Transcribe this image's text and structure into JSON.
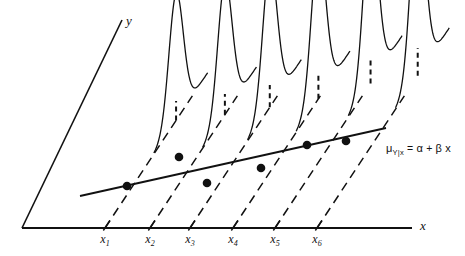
{
  "figure": {
    "background_color": "#ffffff",
    "stroke_color": "#111111",
    "width": 465,
    "height": 256
  },
  "axes": {
    "y_axis_label": "y",
    "x_axis_label": "x",
    "origin": {
      "x": 22,
      "y": 228
    },
    "y_axis_top": {
      "x": 122,
      "y": 20
    },
    "x_axis_right": {
      "x": 412,
      "y": 228
    }
  },
  "tick_labels": [
    {
      "label": "x",
      "sub": "1",
      "x": 105,
      "y": 232
    },
    {
      "label": "x",
      "sub": "2",
      "x": 150,
      "y": 232
    },
    {
      "label": "x",
      "sub": "3",
      "x": 190,
      "y": 232
    },
    {
      "label": "x",
      "sub": "4",
      "x": 233,
      "y": 232
    },
    {
      "label": "x",
      "sub": "5",
      "x": 275,
      "y": 232
    },
    {
      "label": "x",
      "sub": "6",
      "x": 317,
      "y": 232
    }
  ],
  "equation": {
    "mu": "μ",
    "subscript": "Y|x",
    "equals": "=",
    "alpha": "α",
    "plus": "+",
    "beta": "β",
    "variable": "x",
    "full_text": "μY|x = α + β x",
    "x": 386,
    "y": 142
  },
  "chart_data": {
    "type": "line",
    "xlabel": "x",
    "ylabel": "y",
    "grid": false,
    "legend": null,
    "categories": [
      "x1",
      "x2",
      "x3",
      "x4",
      "x5",
      "x6"
    ],
    "regression_line": {
      "label": "μY|x = α + β x",
      "start": {
        "x": 80,
        "y": 196
      },
      "end": {
        "x": 386,
        "y": 128
      },
      "style": "solid"
    },
    "depth_axis": {
      "description": "dashed baselines receding up-and-right from each x tick",
      "dx": 78,
      "dy": -118,
      "style": "dashed"
    },
    "distributions": [
      {
        "name": "x1",
        "base_x": 105,
        "base_y": 228,
        "peak_x": 127,
        "peak_y": 101,
        "mean_dot": {
          "x": 127,
          "y": 186
        },
        "spread": 13
      },
      {
        "name": "x2",
        "base_x": 150,
        "base_y": 228,
        "peak_x": 172,
        "peak_y": 94,
        "mean_dot": {
          "x": 179,
          "y": 157
        },
        "spread": 13
      },
      {
        "name": "x3",
        "base_x": 190,
        "base_y": 228,
        "peak_x": 212,
        "peak_y": 85,
        "mean_dot": {
          "x": 207,
          "y": 183
        },
        "spread": 13
      },
      {
        "name": "x4",
        "base_x": 233,
        "base_y": 228,
        "peak_x": 257,
        "peak_y": 75,
        "mean_dot": {
          "x": 261,
          "y": 168
        },
        "spread": 13
      },
      {
        "name": "x5",
        "base_x": 275,
        "base_y": 228,
        "peak_x": 303,
        "peak_y": 57,
        "mean_dot": {
          "x": 307,
          "y": 145
        },
        "spread": 13
      },
      {
        "name": "x6",
        "base_x": 317,
        "base_y": 228,
        "peak_x": 348,
        "peak_y": 48,
        "mean_dot": {
          "x": 346,
          "y": 141
        },
        "spread": 13
      }
    ]
  }
}
